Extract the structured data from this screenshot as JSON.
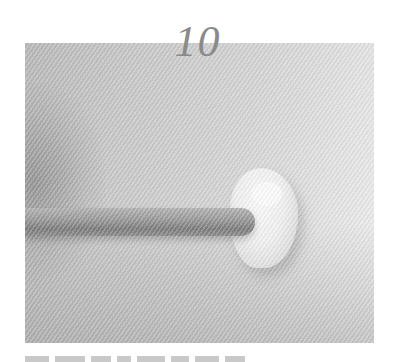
{
  "step": {
    "number": "10"
  },
  "photo": {
    "description": "Grayscale photo of a wooden dowel pressing into a white clay blob on a light surface",
    "tone": "#c8c8c8"
  },
  "caption": {
    "segments": [
      {
        "width": 24
      },
      {
        "width": 30
      },
      {
        "width": 20
      },
      {
        "width": 14
      },
      {
        "width": 28
      },
      {
        "width": 18
      },
      {
        "width": 24
      },
      {
        "width": 20
      }
    ]
  }
}
